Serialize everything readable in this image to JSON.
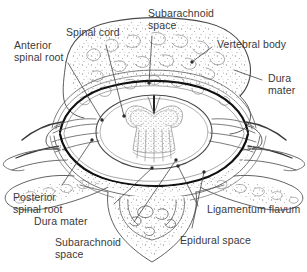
{
  "figure": {
    "line_color": "#4a4a4a",
    "dura_color": "#111111",
    "text_color": "#3a3a3a",
    "background_color": "#ffffff",
    "stipple_color": "#8a8a8a"
  },
  "labels": [
    {
      "id": "subarachnoid-space-top",
      "line1": "Subarachnoid",
      "line2": "space"
    },
    {
      "id": "spinal-cord",
      "line1": "Spinal cord",
      "line2": ""
    },
    {
      "id": "vertebral-body",
      "line1": "Vertebral body",
      "line2": ""
    },
    {
      "id": "anterior-spinal-root",
      "line1": "Anterior",
      "line2": "spinal root"
    },
    {
      "id": "dura-mater-right",
      "line1": "Dura",
      "line2": "mater"
    },
    {
      "id": "posterior-spinal-root",
      "line1": "Posterior",
      "line2": "spinal root"
    },
    {
      "id": "dura-mater-bottom",
      "line1": "Dura mater",
      "line2": ""
    },
    {
      "id": "subarachnoid-space-bottom",
      "line1": "Subarachnoid",
      "line2": "space"
    },
    {
      "id": "ligamentum-flavum",
      "line1": "Ligamentum flavum",
      "line2": ""
    },
    {
      "id": "epidural-space",
      "line1": "Epidural space",
      "line2": ""
    }
  ]
}
